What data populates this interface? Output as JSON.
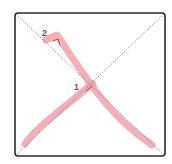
{
  "diagram": {
    "type": "stroke-order",
    "character": "乂",
    "colors": {
      "border": "#2b2b2b",
      "guide": "#8a8a9a",
      "stroke": "#f4a6ae",
      "stroke_outline": "#ee8f9a",
      "label": "#d0304a",
      "arrow": "#d0304a"
    },
    "strokes": [
      {
        "number": "1",
        "name": "left-falling stroke"
      },
      {
        "number": "2",
        "name": "right-falling stroke"
      }
    ]
  }
}
